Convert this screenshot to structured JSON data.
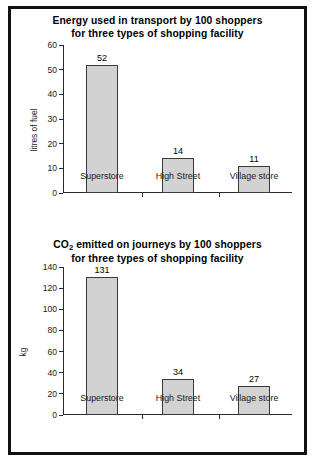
{
  "chart_data": [
    {
      "type": "bar",
      "id": "energy-chart",
      "title_line1": "Energy used in transport by 100 shoppers",
      "title_line2": "for three types of shopping facility",
      "categories": [
        "Superstore",
        "High Street",
        "Village store"
      ],
      "values": [
        52,
        14,
        11
      ],
      "value_labels": [
        "52",
        "14",
        "11"
      ],
      "xlabel": "",
      "ylabel": "litres of fuel",
      "ylim": [
        0,
        60
      ],
      "ytick_step": 10,
      "ytick_labels": [
        "0",
        "10",
        "20",
        "30",
        "40",
        "50",
        "60"
      ],
      "grid": false,
      "legend": "none",
      "bar_fill": "#d2d2d2",
      "bar_stroke": "#3a3a3a"
    },
    {
      "type": "bar",
      "id": "co2-chart",
      "title_line1_pre": "CO",
      "title_line1_sub": "2",
      "title_line1_post": " emitted on journeys by 100 shoppers",
      "title_line2": "for three types of shopping facility",
      "categories": [
        "Superstore",
        "High Street",
        "Village store"
      ],
      "values": [
        131,
        34,
        27
      ],
      "value_labels": [
        "131",
        "34",
        "27"
      ],
      "xlabel": "",
      "ylabel": "kg",
      "ylim": [
        0,
        140
      ],
      "ytick_step": 20,
      "ytick_labels": [
        "0",
        "20",
        "40",
        "60",
        "80",
        "100",
        "120",
        "140"
      ],
      "grid": false,
      "legend": "none",
      "bar_fill": "#d2d2d2",
      "bar_stroke": "#3a3a3a"
    }
  ]
}
